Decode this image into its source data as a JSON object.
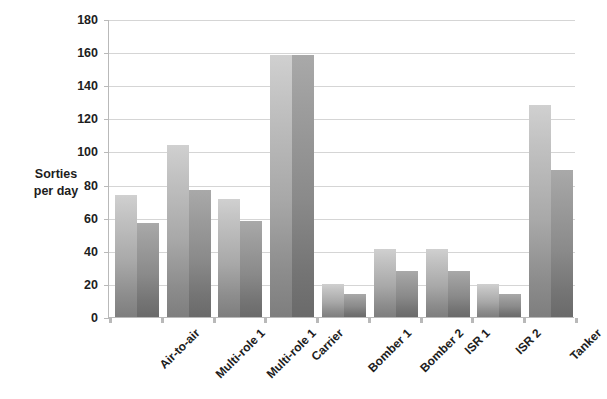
{
  "chart_data": {
    "type": "bar",
    "title": "",
    "xlabel": "",
    "ylabel": "Sorties per day",
    "ylabel_lines": [
      "Sorties",
      "per day"
    ],
    "categories": [
      "Air-to-air",
      "Multi-role 1",
      "Multi-role 1",
      "Carrier",
      "Bomber 1",
      "Bomber 2",
      "ISR 1",
      "ISR 2",
      "Tanker"
    ],
    "series": [
      {
        "name": "series-1",
        "values": [
          74,
          104,
          71,
          158,
          20,
          41,
          41,
          20,
          128
        ]
      },
      {
        "name": "series-2",
        "values": [
          57,
          77,
          58,
          158,
          14,
          28,
          28,
          14,
          89
        ]
      }
    ],
    "ylim": [
      0,
      180
    ],
    "yticks": [
      0,
      20,
      40,
      60,
      80,
      100,
      120,
      140,
      160,
      180
    ],
    "ytick_labels": [
      "0",
      "20",
      "40",
      "60",
      "80",
      "100",
      "120",
      "140",
      "160",
      "180"
    ],
    "grid": true,
    "legend": false,
    "legend_position": "none",
    "colors": {
      "series_1_top": "#d0d0d0",
      "series_1_bottom": "#7e7e7e",
      "series_2_top": "#a9a9a9",
      "series_2_bottom": "#6a6a6a",
      "gridline": "#d5d5d5",
      "axis": "#b9b9b9",
      "text": "#1d1d1d",
      "background": "#ffffff"
    }
  }
}
